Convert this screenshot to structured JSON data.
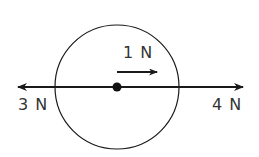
{
  "diagram": {
    "type": "free-body-diagram",
    "forces": [
      {
        "label": "3 N",
        "direction": "left"
      },
      {
        "label": "4 N",
        "direction": "right"
      },
      {
        "label": "1 N",
        "direction": "right",
        "role": "net force"
      }
    ],
    "colors": {
      "stroke": "#1a1a1a",
      "text": "#333333",
      "background": "#ffffff"
    }
  }
}
